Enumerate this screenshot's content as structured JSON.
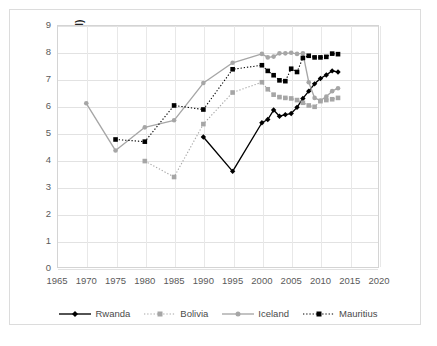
{
  "chart_data": {
    "type": "line",
    "title": "",
    "xlabel": "",
    "ylabel": "EFW Score (chain-linked)",
    "xlim": [
      1965,
      2020
    ],
    "ylim": [
      0,
      9
    ],
    "xticks": [
      1965,
      1970,
      1975,
      1980,
      1985,
      1990,
      1995,
      2000,
      2005,
      2010,
      2015,
      2020
    ],
    "yticks": [
      0,
      1,
      2,
      3,
      4,
      5,
      6,
      7,
      8,
      9
    ],
    "grid": true,
    "legend_position": "bottom",
    "series": [
      {
        "name": "Rwanda",
        "color": "#000000",
        "line_style": "solid",
        "marker": "diamond",
        "points": [
          {
            "x": 1990,
            "y": 4.85
          },
          {
            "x": 1995,
            "y": 3.58
          },
          {
            "x": 2000,
            "y": 5.38
          },
          {
            "x": 2001,
            "y": 5.5
          },
          {
            "x": 2002,
            "y": 5.85
          },
          {
            "x": 2003,
            "y": 5.62
          },
          {
            "x": 2004,
            "y": 5.68
          },
          {
            "x": 2005,
            "y": 5.72
          },
          {
            "x": 2006,
            "y": 5.95
          },
          {
            "x": 2007,
            "y": 6.28
          },
          {
            "x": 2008,
            "y": 6.55
          },
          {
            "x": 2009,
            "y": 6.82
          },
          {
            "x": 2010,
            "y": 7.02
          },
          {
            "x": 2011,
            "y": 7.15
          },
          {
            "x": 2012,
            "y": 7.3
          },
          {
            "x": 2013,
            "y": 7.26
          }
        ]
      },
      {
        "name": "Bolivia",
        "color": "#a6a6a6",
        "line_style": "dotted",
        "marker": "square",
        "points": [
          {
            "x": 1980,
            "y": 3.96
          },
          {
            "x": 1985,
            "y": 3.37
          },
          {
            "x": 1990,
            "y": 5.33
          },
          {
            "x": 1995,
            "y": 6.5
          },
          {
            "x": 2000,
            "y": 6.88
          },
          {
            "x": 2001,
            "y": 6.62
          },
          {
            "x": 2002,
            "y": 6.42
          },
          {
            "x": 2003,
            "y": 6.33
          },
          {
            "x": 2004,
            "y": 6.3
          },
          {
            "x": 2005,
            "y": 6.28
          },
          {
            "x": 2006,
            "y": 6.22
          },
          {
            "x": 2007,
            "y": 6.12
          },
          {
            "x": 2008,
            "y": 6.02
          },
          {
            "x": 2009,
            "y": 5.97
          },
          {
            "x": 2010,
            "y": 6.18
          },
          {
            "x": 2011,
            "y": 6.22
          },
          {
            "x": 2012,
            "y": 6.25
          },
          {
            "x": 2013,
            "y": 6.3
          }
        ]
      },
      {
        "name": "Iceland",
        "color": "#a6a6a6",
        "line_style": "solid",
        "marker": "circle",
        "points": [
          {
            "x": 1970,
            "y": 6.1
          },
          {
            "x": 1975,
            "y": 4.35
          },
          {
            "x": 1980,
            "y": 5.21
          },
          {
            "x": 1985,
            "y": 5.47
          },
          {
            "x": 1990,
            "y": 6.85
          },
          {
            "x": 1995,
            "y": 7.6
          },
          {
            "x": 2000,
            "y": 7.93
          },
          {
            "x": 2001,
            "y": 7.8
          },
          {
            "x": 2002,
            "y": 7.83
          },
          {
            "x": 2003,
            "y": 7.95
          },
          {
            "x": 2004,
            "y": 7.95
          },
          {
            "x": 2005,
            "y": 7.97
          },
          {
            "x": 2006,
            "y": 7.93
          },
          {
            "x": 2007,
            "y": 7.95
          },
          {
            "x": 2008,
            "y": 6.88
          },
          {
            "x": 2009,
            "y": 6.3
          },
          {
            "x": 2010,
            "y": 6.2
          },
          {
            "x": 2011,
            "y": 6.35
          },
          {
            "x": 2012,
            "y": 6.55
          },
          {
            "x": 2013,
            "y": 6.66
          }
        ]
      },
      {
        "name": "Mauritius",
        "color": "#000000",
        "line_style": "dotted",
        "marker": "square",
        "points": [
          {
            "x": 1975,
            "y": 4.76
          },
          {
            "x": 1980,
            "y": 4.68
          },
          {
            "x": 1985,
            "y": 6.02
          },
          {
            "x": 1990,
            "y": 5.87
          },
          {
            "x": 1995,
            "y": 7.36
          },
          {
            "x": 2000,
            "y": 7.51
          },
          {
            "x": 2001,
            "y": 7.3
          },
          {
            "x": 2002,
            "y": 7.14
          },
          {
            "x": 2003,
            "y": 6.95
          },
          {
            "x": 2004,
            "y": 6.92
          },
          {
            "x": 2005,
            "y": 7.38
          },
          {
            "x": 2006,
            "y": 7.26
          },
          {
            "x": 2007,
            "y": 7.78
          },
          {
            "x": 2008,
            "y": 7.86
          },
          {
            "x": 2009,
            "y": 7.8
          },
          {
            "x": 2010,
            "y": 7.8
          },
          {
            "x": 2011,
            "y": 7.82
          },
          {
            "x": 2012,
            "y": 7.94
          },
          {
            "x": 2013,
            "y": 7.92
          }
        ]
      }
    ]
  },
  "legend": {
    "items": [
      {
        "label": "Rwanda"
      },
      {
        "label": "Bolivia"
      },
      {
        "label": "Iceland"
      },
      {
        "label": "Mauritius"
      }
    ]
  }
}
